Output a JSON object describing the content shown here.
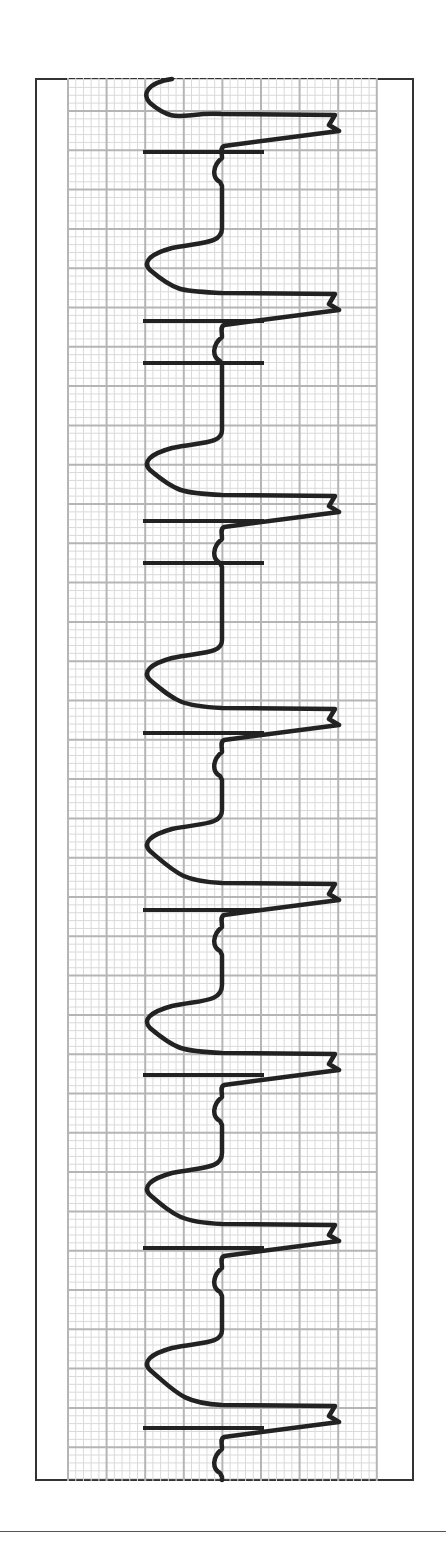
{
  "chart_data": {
    "type": "line",
    "title": "",
    "orientation": "vertical",
    "grid": {
      "on": true,
      "x_start": 68,
      "x_end": 377,
      "y_start": 78,
      "y_end": 1481,
      "major_spacing_x": 38.6,
      "major_spacing_y": 39.3,
      "major_offset_y": 33,
      "minor_divisions": 5,
      "major_color": "#b5b5b5",
      "minor_color": "#dadada"
    },
    "baseline_x": 222,
    "trace_color": "#222222",
    "beats": [
      {
        "s_peak_y": 95,
        "r_spike_y": 124,
        "t_start_y": 78
      },
      {
        "s_peak_y": 262,
        "r_spike_y": 303,
        "t_start_y": 228
      },
      {
        "s_peak_y": 462,
        "r_spike_y": 505,
        "t_start_y": 430
      },
      {
        "s_peak_y": 672,
        "r_spike_y": 718,
        "t_start_y": 640
      },
      {
        "s_peak_y": 843,
        "r_spike_y": 893,
        "t_start_y": 810
      },
      {
        "s_peak_y": 1020,
        "r_spike_y": 1063,
        "t_start_y": 985
      },
      {
        "s_peak_y": 1187,
        "r_spike_y": 1234,
        "t_start_y": 1153
      },
      {
        "s_peak_y": 1362,
        "r_spike_y": 1415,
        "t_start_y": 1330
      }
    ],
    "markers": [
      152,
      321,
      363,
      521,
      563,
      733,
      910,
      1075,
      1248,
      1428
    ],
    "marker_x_range": [
      143,
      264
    ],
    "spike_tip_x": 337,
    "s_peak_x": 146
  }
}
